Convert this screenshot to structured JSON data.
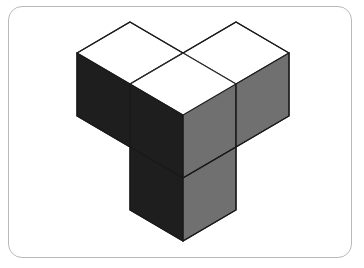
{
  "card": {
    "background_color": "#ffffff",
    "border_color": "#b9b9b9",
    "corner_radius_px": 14
  },
  "figure": {
    "cube_count": 4,
    "projection": "isometric",
    "unit": {
      "half_width_px": 53,
      "rise_px": 31,
      "vertical_px": 63
    },
    "palette": {
      "top_face": "#ffffff",
      "left_face": "#1e1e1e",
      "right_face": "#707070",
      "outline": "#1a1a1a",
      "inner_line": "#2a2a2a"
    },
    "cubes": [
      {
        "name": "left-arm-cube",
        "grid": [
          1,
          0,
          0
        ],
        "visible_faces": [
          "top",
          "left",
          "right"
        ]
      },
      {
        "name": "center-cube",
        "grid": [
          0,
          0,
          0
        ],
        "visible_faces": [
          "top",
          "left",
          "right"
        ]
      },
      {
        "name": "right-arm-cube",
        "grid": [
          0,
          1,
          0
        ],
        "visible_faces": [
          "top",
          "left",
          "right"
        ]
      },
      {
        "name": "front-arm-cube",
        "grid": [
          0,
          0,
          -1
        ],
        "visible_faces": [
          "left",
          "right"
        ]
      }
    ],
    "vertices": {
      "left_apex": [
        130,
        22
      ],
      "right_apex": [
        236,
        22
      ],
      "center_x": [
        183,
        55
      ],
      "left_corner": [
        76,
        55
      ],
      "right_corner": [
        290,
        55
      ],
      "bottom_tip": [
        183,
        243
      ]
    }
  }
}
